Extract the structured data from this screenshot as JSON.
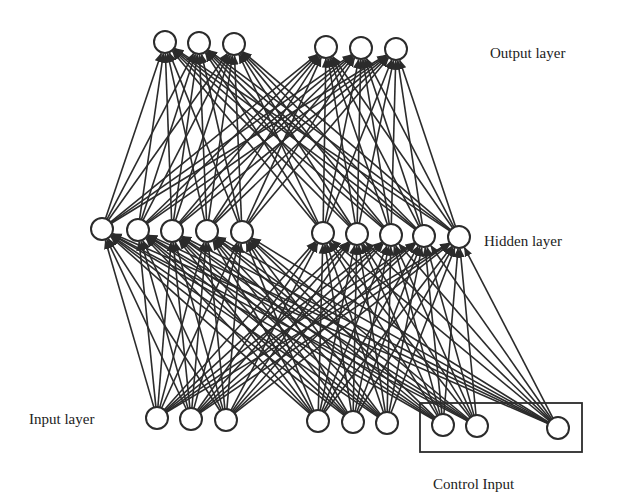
{
  "labels": {
    "output_layer": "Output layer",
    "hidden_layer": "Hidden layer",
    "input_layer": "Input layer",
    "control_input": "Control Input"
  },
  "colors": {
    "stroke": "#2b2b2b",
    "background": "#ffffff",
    "text": "#222222"
  },
  "node_radius": 11,
  "layers": {
    "output": [
      {
        "x": 165,
        "y": 42
      },
      {
        "x": 199,
        "y": 43
      },
      {
        "x": 234,
        "y": 44
      },
      {
        "x": 326,
        "y": 47
      },
      {
        "x": 361,
        "y": 48
      },
      {
        "x": 396,
        "y": 49
      }
    ],
    "hidden": [
      {
        "x": 102,
        "y": 229
      },
      {
        "x": 138,
        "y": 230
      },
      {
        "x": 172,
        "y": 231
      },
      {
        "x": 207,
        "y": 231
      },
      {
        "x": 242,
        "y": 232
      },
      {
        "x": 323,
        "y": 233
      },
      {
        "x": 357,
        "y": 234
      },
      {
        "x": 391,
        "y": 235
      },
      {
        "x": 424,
        "y": 236
      },
      {
        "x": 459,
        "y": 237
      }
    ],
    "input": [
      {
        "x": 157,
        "y": 418
      },
      {
        "x": 191,
        "y": 419
      },
      {
        "x": 226,
        "y": 420
      },
      {
        "x": 318,
        "y": 421
      },
      {
        "x": 353,
        "y": 422
      },
      {
        "x": 387,
        "y": 423
      }
    ],
    "control": [
      {
        "x": 443,
        "y": 425
      },
      {
        "x": 477,
        "y": 426
      },
      {
        "x": 558,
        "y": 428
      }
    ]
  },
  "control_box": {
    "x1": 420,
    "y1": 403,
    "x2": 582,
    "y2": 452
  },
  "connections": [
    {
      "from": "hidden",
      "to": "output",
      "pattern": "fully-connected"
    },
    {
      "from": "input",
      "to": "hidden",
      "pattern": "fully-connected"
    },
    {
      "from": "control",
      "to": "hidden",
      "pattern": "fully-connected"
    }
  ]
}
